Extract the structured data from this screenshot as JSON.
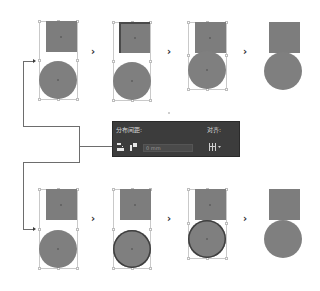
{
  "diagram": {
    "colors": {
      "shape_fill": "#7d7d7d",
      "key_outline": "#3f3f3f",
      "selection_box": "#c9c9c9",
      "connector": "#6d6d6d",
      "panel_bg": "#3c3c3c",
      "panel_text": "#d8d8d8"
    },
    "step_arrow_glyph": "›",
    "rows": [
      {
        "name": "top-row",
        "key_object": "square",
        "steps": [
          {
            "label": "Step 1: select square and circle",
            "selected": true,
            "key": "none"
          },
          {
            "label": "Step 2: click square as key object",
            "selected": true,
            "key": "square"
          },
          {
            "label": "Step 3: distribute spacing 0",
            "selected": true,
            "key": "none"
          },
          {
            "label": "Result",
            "selected": false,
            "key": "none"
          }
        ]
      },
      {
        "name": "bottom-row",
        "key_object": "circle",
        "steps": [
          {
            "label": "Step 1: select square and circle",
            "selected": true,
            "key": "none"
          },
          {
            "label": "Step 2: click circle as key object",
            "selected": true,
            "key": "circle"
          },
          {
            "label": "Step 3: distribute spacing 0",
            "selected": true,
            "key": "circle"
          },
          {
            "label": "Result",
            "selected": false,
            "key": "none"
          }
        ]
      }
    ],
    "panel": {
      "left_label": "分布间距:",
      "right_label": "对齐:",
      "field_value": "0 mm",
      "icons": [
        "vertical-distribute-space-icon",
        "horizontal-distribute-space-icon",
        "align-to-menu-icon"
      ]
    }
  }
}
